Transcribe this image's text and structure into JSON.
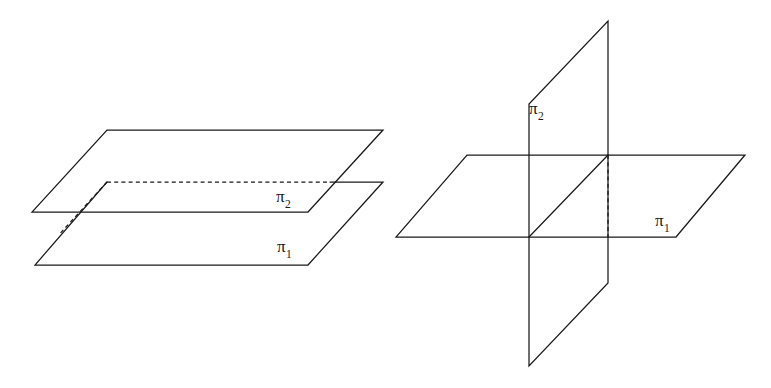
{
  "figure": {
    "background_color": "#ffffff",
    "stroke_color": "#1a1a1a",
    "width": 771,
    "height": 388,
    "panels": [
      {
        "id": "parallel-planes",
        "caption": "Two parallel planes",
        "labels": [
          {
            "id": "left-pi2",
            "base": "π",
            "subscript": "2",
            "text": "π₂"
          },
          {
            "id": "left-pi1",
            "base": "π",
            "subscript": "1",
            "text": "π₁"
          }
        ]
      },
      {
        "id": "intersecting-planes",
        "caption": "Two intersecting planes",
        "labels": [
          {
            "id": "right-pi2",
            "base": "π",
            "subscript": "2",
            "text": "π₂"
          },
          {
            "id": "right-pi1",
            "base": "π",
            "subscript": "1",
            "text": "π₁"
          }
        ]
      }
    ]
  },
  "chart_data": {
    "type": "diagram",
    "panels": [
      {
        "name": "parallel-planes",
        "shapes": [
          {
            "name": "upper-plane-pi2",
            "kind": "parallelogram",
            "vertices": [
              [
                107,
                130
              ],
              [
                383,
                130
              ],
              [
                308,
                212
              ],
              [
                32,
                212
              ]
            ],
            "visible_edges": [
              [
                [
                  107,
                  130
                ],
                [
                  383,
                  130
                ]
              ],
              [
                [
                  383,
                  130
                ],
                [
                  308,
                  212
                ]
              ],
              [
                [
                  308,
                  212
                ],
                [
                  32,
                  212
                ]
              ],
              [
                [
                  32,
                  212
                ],
                [
                  107,
                  130
                ]
              ]
            ],
            "hidden_edges": []
          },
          {
            "name": "lower-plane-pi1",
            "kind": "parallelogram",
            "vertices": [
              [
                107,
                182
              ],
              [
                383,
                182
              ],
              [
                308,
                265
              ],
              [
                35,
                265
              ]
            ],
            "visible_edges": [
              [
                [
                  330,
                  182
                ],
                [
                  383,
                  182
                ]
              ],
              [
                [
                  383,
                  182
                ],
                [
                  308,
                  265
                ]
              ],
              [
                [
                  308,
                  265
                ],
                [
                  35,
                  265
                ]
              ],
              [
                [
                  35,
                  265
                ],
                [
                  107,
                  182
                ]
              ]
            ],
            "hidden_edges": [
              [
                [
                  107,
                  182
                ],
                [
                  330,
                  182
                ]
              ],
              [
                [
                  107,
                  182
                ],
                [
                  60,
                  233
                ]
              ]
            ]
          }
        ]
      },
      {
        "name": "intersecting-planes",
        "shapes": [
          {
            "name": "horizontal-plane-pi1",
            "kind": "parallelogram",
            "vertices": [
              [
                467,
                155
              ],
              [
                745,
                155
              ],
              [
                676,
                237
              ],
              [
                396,
                237
              ]
            ],
            "visible_edges": [
              [
                [
                  467,
                  155
                ],
                [
                  745,
                  155
                ]
              ],
              [
                [
                  745,
                  155
                ],
                [
                  676,
                  237
                ]
              ],
              [
                [
                  676,
                  237
                ],
                [
                  396,
                  237
                ]
              ],
              [
                [
                  396,
                  237
                ],
                [
                  467,
                  155
                ]
              ]
            ],
            "hidden_edges": []
          },
          {
            "name": "vertical-plane-pi2",
            "kind": "quadrilateral",
            "vertices": [
              [
                608,
                21
              ],
              [
                608,
                283
              ],
              [
                529,
                366
              ],
              [
                529,
                104
              ]
            ],
            "visible_edges": [
              [
                [
                  608,
                  21
                ],
                [
                  608,
                  283
                ]
              ],
              [
                [
                  608,
                  283
                ],
                [
                  529,
                  366
                ]
              ],
              [
                [
                  529,
                  366
                ],
                [
                  529,
                  104
                ]
              ],
              [
                [
                  529,
                  104
                ],
                [
                  608,
                  21
                ]
              ]
            ],
            "hidden_edges": []
          },
          {
            "name": "line-of-intersection",
            "kind": "segment",
            "visible_edges": [
              [
                [
                  529,
                  237
                ],
                [
                  608,
                  155
                ]
              ]
            ],
            "hidden_edges": [
              [
                [
                  608,
                  155
                ],
                [
                  608,
                  237
                ]
              ]
            ]
          }
        ]
      }
    ]
  }
}
